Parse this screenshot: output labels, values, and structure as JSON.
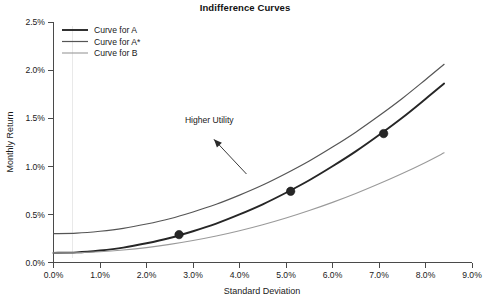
{
  "chart_data": {
    "type": "line",
    "title": "Indifference Curves",
    "xlabel": "Standard Deviation",
    "ylabel": "Monthly Return",
    "xlim": [
      0.0,
      9.0
    ],
    "ylim": [
      0.0,
      2.5
    ],
    "grid": false,
    "legend_position": "top-left",
    "x_tick_labels": [
      "0.0%",
      "1.0%",
      "2.0%",
      "3.0%",
      "4.0%",
      "5.0%",
      "6.0%",
      "7.0%",
      "8.0%",
      "9.0%"
    ],
    "x_tick_values": [
      0.0,
      1.0,
      2.0,
      3.0,
      4.0,
      5.0,
      6.0,
      7.0,
      8.0,
      9.0
    ],
    "y_tick_labels": [
      "0.0%",
      "0.5%",
      "1.0%",
      "1.5%",
      "2.0%",
      "2.5%"
    ],
    "y_tick_values": [
      0.0,
      0.5,
      1.0,
      1.5,
      2.0,
      2.5
    ],
    "series": [
      {
        "name": "Curve for A",
        "color": "#262626",
        "width": 1.9,
        "x": [
          0.0,
          0.5,
          1.0,
          1.5,
          2.0,
          2.5,
          3.0,
          3.5,
          4.0,
          4.5,
          5.0,
          5.5,
          6.0,
          6.5,
          7.0,
          7.5,
          8.0,
          8.4
        ],
        "y": [
          0.1,
          0.105,
          0.125,
          0.155,
          0.2,
          0.255,
          0.325,
          0.405,
          0.5,
          0.605,
          0.725,
          0.855,
          1.0,
          1.155,
          1.325,
          1.505,
          1.7,
          1.86
        ]
      },
      {
        "name": "Curve for A*",
        "color": "#555555",
        "width": 1.2,
        "x": [
          0.0,
          0.5,
          1.0,
          1.5,
          2.0,
          2.5,
          3.0,
          3.5,
          4.0,
          4.5,
          5.0,
          5.5,
          6.0,
          6.5,
          7.0,
          7.5,
          8.0,
          8.4
        ],
        "y": [
          0.3,
          0.305,
          0.325,
          0.355,
          0.4,
          0.455,
          0.525,
          0.605,
          0.7,
          0.805,
          0.925,
          1.055,
          1.2,
          1.355,
          1.525,
          1.705,
          1.9,
          2.06
        ]
      },
      {
        "name": "Curve for B",
        "color": "#9a9a9a",
        "width": 1.1,
        "x": [
          0.0,
          0.5,
          1.0,
          1.5,
          2.0,
          2.5,
          3.0,
          3.5,
          4.0,
          4.5,
          5.0,
          5.5,
          6.0,
          6.5,
          7.0,
          7.5,
          8.0,
          8.4
        ],
        "y": [
          0.1,
          0.102,
          0.112,
          0.13,
          0.155,
          0.188,
          0.228,
          0.275,
          0.33,
          0.392,
          0.462,
          0.54,
          0.625,
          0.717,
          0.818,
          0.925,
          1.04,
          1.14
        ]
      }
    ],
    "markers": [
      {
        "label": "point-1",
        "x": 2.7,
        "y": 0.29,
        "series": "Curve for A"
      },
      {
        "label": "point-2",
        "x": 5.1,
        "y": 0.74,
        "series": "Curve for A"
      },
      {
        "label": "point-3",
        "x": 7.1,
        "y": 1.34,
        "series": "Curve for A"
      }
    ],
    "marker_color": "#262626",
    "marker_radius": 4.2,
    "annotations": [
      {
        "text": "Higher Utility",
        "text_x": 3.35,
        "text_y": 1.45,
        "arrow_from_x": 4.15,
        "arrow_from_y": 0.92,
        "arrow_to_x": 3.45,
        "arrow_to_y": 1.28
      }
    ]
  },
  "legend": {
    "entries": [
      {
        "label": "Curve for A",
        "color": "#262626",
        "width": 1.9
      },
      {
        "label": "Curve for A*",
        "color": "#555555",
        "width": 1.2
      },
      {
        "label": "Curve for B",
        "color": "#9a9a9a",
        "width": 1.1
      }
    ]
  }
}
